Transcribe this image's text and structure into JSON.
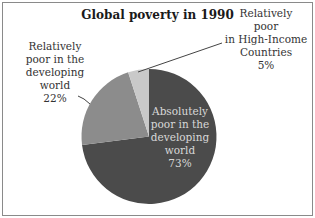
{
  "chart_data": {
    "type": "pie",
    "title": "Global poverty in 1990",
    "start_angle": "12 o'clock, clockwise",
    "slices": [
      {
        "label": "Absolutely poor in the developing world",
        "value": 73,
        "display": "73%",
        "color": "#4b4b4b"
      },
      {
        "label": "Relatively poor in the developing world",
        "value": 22,
        "display": "22%",
        "color": "#8c8c8c"
      },
      {
        "label": "Relatively poor in High-Income Countries",
        "value": 5,
        "display": "5%",
        "color": "#c9c9c9"
      }
    ],
    "legend": "none (direct labels with leader lines)"
  },
  "labels": {
    "title": "Global poverty in 1990",
    "center": [
      "Absolutely",
      "poor in the",
      "developing",
      "world",
      "73%"
    ],
    "left": [
      "Relatively",
      "poor in the",
      "developing",
      "world",
      "22%"
    ],
    "right": [
      "Relatively",
      "poor",
      "in High-Income",
      "Countries",
      "5%"
    ]
  }
}
